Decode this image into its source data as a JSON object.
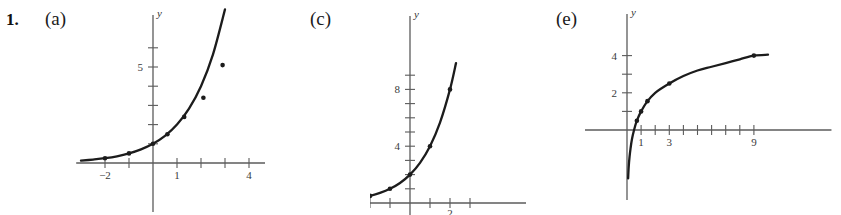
{
  "problem": {
    "number": "1.",
    "parts": [
      {
        "id": "a",
        "label": "(a)"
      },
      {
        "id": "c",
        "label": "(c)"
      },
      {
        "id": "e",
        "label": "(e)"
      }
    ]
  },
  "chart_data": [
    {
      "id": "a",
      "type": "line",
      "title": "",
      "xlabel": "x",
      "ylabel": "y",
      "xlim": [
        -3.2,
        5.4
      ],
      "ylim": [
        -1.6,
        8.2
      ],
      "grid": false,
      "legend_position": "none",
      "x_tick_labels": [
        {
          "value": -2,
          "text": "−2"
        },
        {
          "value": 1,
          "text": "1"
        },
        {
          "value": 4,
          "text": "4"
        }
      ],
      "y_tick_labels": [
        {
          "value": 5,
          "text": "5"
        }
      ],
      "x_ticks": [
        -2,
        -1,
        1,
        2,
        3,
        4,
        5
      ],
      "y_ticks": [
        1,
        2,
        3,
        4,
        5,
        6
      ],
      "series": [
        {
          "name": "curve",
          "x": [
            -3.0,
            -2.5,
            -2.0,
            -1.5,
            -1.0,
            -0.5,
            0.0,
            0.5,
            1.0,
            1.5,
            2.0,
            2.5,
            3.0,
            3.5,
            4.0,
            4.3,
            4.6
          ],
          "y": [
            0.12,
            0.18,
            0.25,
            0.35,
            0.5,
            0.71,
            1.0,
            1.41,
            2.0,
            2.83,
            4.0,
            5.66,
            8.0,
            11.3,
            16.0,
            20.1,
            24.3
          ]
        }
      ],
      "markers": [
        {
          "x": -2.0,
          "y": 0.25
        },
        {
          "x": -1.0,
          "y": 0.5
        },
        {
          "x": 0.0,
          "y": 1.0
        },
        {
          "x": 0.6,
          "y": 1.5
        },
        {
          "x": 1.3,
          "y": 2.4
        },
        {
          "x": 2.1,
          "y": 3.4
        },
        {
          "x": 2.9,
          "y": 5.1
        }
      ]
    },
    {
      "id": "c",
      "type": "line",
      "title": "",
      "xlabel": "x",
      "ylabel": "y",
      "xlim": [
        -3.6,
        3.6
      ],
      "ylim": [
        -1.1,
        11.6
      ],
      "grid": false,
      "legend_position": "none",
      "x_tick_labels": [
        {
          "value": 2,
          "text": "2",
          "clipped": true
        }
      ],
      "y_tick_labels": [
        {
          "value": 4,
          "text": "4"
        },
        {
          "value": 8,
          "text": "8"
        }
      ],
      "x_ticks": [
        -2,
        -1,
        1,
        2,
        3
      ],
      "y_ticks": [
        1,
        2,
        3,
        4,
        5,
        6,
        7,
        8,
        9
      ],
      "series": [
        {
          "name": "curve",
          "x": [
            -3.4,
            -3.0,
            -2.5,
            -2.0,
            -1.5,
            -1.0,
            -0.5,
            0.0,
            0.5,
            1.0,
            1.5,
            2.0,
            2.3
          ],
          "y": [
            0.19,
            0.25,
            0.35,
            0.5,
            0.71,
            1.0,
            1.41,
            2.0,
            2.83,
            4.0,
            5.66,
            8.0,
            9.85
          ]
        }
      ],
      "markers": [
        {
          "x": -2.0,
          "y": 0.5
        },
        {
          "x": -1.0,
          "y": 1.0
        },
        {
          "x": 0.0,
          "y": 2.0
        },
        {
          "x": 1.0,
          "y": 4.0
        },
        {
          "x": 2.0,
          "y": 8.0
        }
      ]
    },
    {
      "id": "e",
      "type": "line",
      "title": "",
      "xlabel": "",
      "ylabel": "y",
      "xlim": [
        -3.2,
        13.0
      ],
      "ylim": [
        -3.0,
        5.6
      ],
      "grid": false,
      "legend_position": "none",
      "x_tick_labels": [
        {
          "value": 1,
          "text": "1"
        },
        {
          "value": 3,
          "text": "3"
        },
        {
          "value": 9,
          "text": "9"
        }
      ],
      "y_tick_labels": [
        {
          "value": 2,
          "text": "2"
        },
        {
          "value": 4,
          "text": "4"
        }
      ],
      "x_ticks": [
        1,
        2,
        3,
        4,
        5,
        6,
        7,
        8,
        9
      ],
      "y_ticks": [
        1,
        2,
        3,
        4
      ],
      "series": [
        {
          "name": "curve",
          "x": [
            0.08,
            0.12,
            0.18,
            0.25,
            0.35,
            0.5,
            0.7,
            1.0,
            1.4,
            2.0,
            3.0,
            4.0,
            5.0,
            6.0,
            7.0,
            8.0,
            9.0,
            10.0
          ],
          "y": [
            -2.6,
            -2.0,
            -1.45,
            -1.0,
            -0.5,
            0.0,
            0.5,
            1.0,
            1.5,
            2.0,
            2.5,
            2.9,
            3.2,
            3.4,
            3.6,
            3.8,
            4.0,
            4.05
          ]
        }
      ],
      "markers": [
        {
          "x": 0.7,
          "y": 0.5
        },
        {
          "x": 1.0,
          "y": 1.0
        },
        {
          "x": 1.45,
          "y": 1.55
        },
        {
          "x": 3.0,
          "y": 2.5
        },
        {
          "x": 9.0,
          "y": 4.0
        }
      ]
    }
  ]
}
